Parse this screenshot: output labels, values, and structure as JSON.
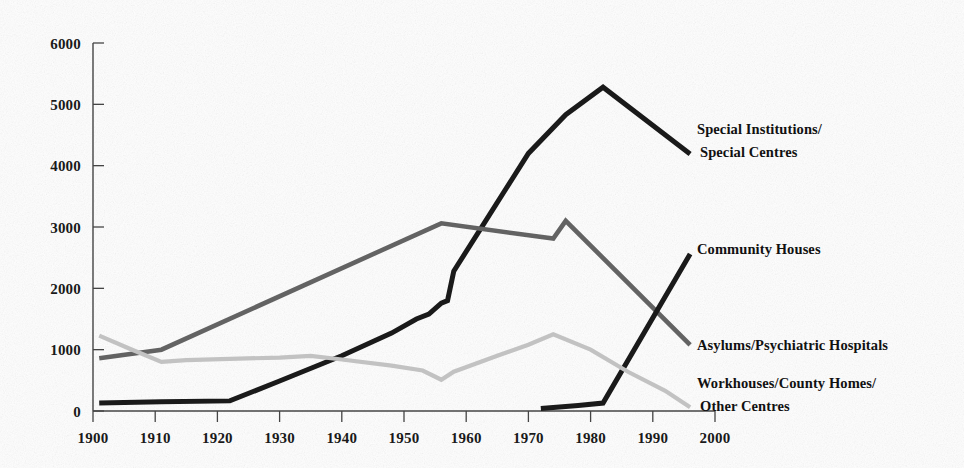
{
  "chart_data": {
    "type": "line",
    "title": "",
    "subtitle": "",
    "xlabel": "",
    "ylabel": "",
    "xlim": [
      1900,
      2000
    ],
    "ylim": [
      0,
      6000
    ],
    "grid": false,
    "legend_position": "right-inline-labels",
    "x_ticks": [
      1900,
      1910,
      1920,
      1930,
      1940,
      1950,
      1960,
      1970,
      1980,
      1990,
      2000
    ],
    "y_ticks": [
      0,
      1000,
      2000,
      3000,
      4000,
      5000,
      6000
    ],
    "x_tick_labels": [
      "1900",
      "1910",
      "1920",
      "1930",
      "1940",
      "1950",
      "1960",
      "1970",
      "1980",
      "1990",
      "2000"
    ],
    "y_tick_labels": [
      "0",
      "1000",
      "2000",
      "3000",
      "4000",
      "5000",
      "6000"
    ],
    "series": [
      {
        "name": "Special Institutions/Special Centres",
        "label_lines": [
          "Special Institutions/",
          "Special Centres"
        ],
        "color": "#1a1a1a",
        "stroke_width": 5.0,
        "points": [
          [
            1901,
            130
          ],
          [
            1911,
            150
          ],
          [
            1922,
            165
          ],
          [
            1930,
            490
          ],
          [
            1940,
            900
          ],
          [
            1948,
            1270
          ],
          [
            1952,
            1500
          ],
          [
            1954,
            1580
          ],
          [
            1956,
            1760
          ],
          [
            1957,
            1800
          ],
          [
            1958,
            2280
          ],
          [
            1963,
            3080
          ],
          [
            1970,
            4200
          ],
          [
            1976,
            4830
          ],
          [
            1982,
            5280
          ],
          [
            1996,
            4190
          ]
        ]
      },
      {
        "name": "Asylums/Psychiatric Hospitals",
        "label_lines": [
          "Asylums/Psychiatric Hospitals"
        ],
        "color": "#636363",
        "stroke_width": 4.6,
        "points": [
          [
            1901,
            860
          ],
          [
            1911,
            1000
          ],
          [
            1956,
            3060
          ],
          [
            1974,
            2810
          ],
          [
            1976,
            3100
          ],
          [
            1996,
            1080
          ]
        ]
      },
      {
        "name": "Community Houses",
        "label_lines": [
          "Community  Houses"
        ],
        "color": "#1a1a1a",
        "stroke_width": 5.0,
        "points": [
          [
            1972,
            40
          ],
          [
            1978,
            90
          ],
          [
            1982,
            130
          ],
          [
            1996,
            2560
          ]
        ]
      },
      {
        "name": "Workhouses/County Homes/Other Centres",
        "label_lines": [
          "Workhouses/County Homes/",
          "Other Centres"
        ],
        "color": "#c2c2c2",
        "stroke_width": 4.2,
        "points": [
          [
            1901,
            1230
          ],
          [
            1906,
            1010
          ],
          [
            1911,
            800
          ],
          [
            1915,
            830
          ],
          [
            1922,
            850
          ],
          [
            1930,
            870
          ],
          [
            1935,
            900
          ],
          [
            1940,
            840
          ],
          [
            1948,
            740
          ],
          [
            1953,
            660
          ],
          [
            1956,
            510
          ],
          [
            1958,
            640
          ],
          [
            1965,
            900
          ],
          [
            1970,
            1080
          ],
          [
            1974,
            1250
          ],
          [
            1980,
            1000
          ],
          [
            1986,
            640
          ],
          [
            1992,
            330
          ],
          [
            1996,
            60
          ]
        ]
      }
    ]
  },
  "annotations": {
    "label_positions": [
      {
        "series": "Special Institutions/Special Centres",
        "x": 697,
        "y": 134
      },
      {
        "series": "Community Houses",
        "x": 697,
        "y": 254
      },
      {
        "series": "Asylums/Psychiatric Hospitals",
        "x": 697,
        "y": 350
      },
      {
        "series": "Workhouses/County Homes/Other Centres",
        "x": 697,
        "y": 388
      }
    ]
  },
  "colors": {
    "background": "#fefefe",
    "axis": "#444444",
    "text": "#1a1a1a",
    "series_dark": "#1a1a1a",
    "series_medium": "#636363",
    "series_light": "#c2c2c2"
  }
}
